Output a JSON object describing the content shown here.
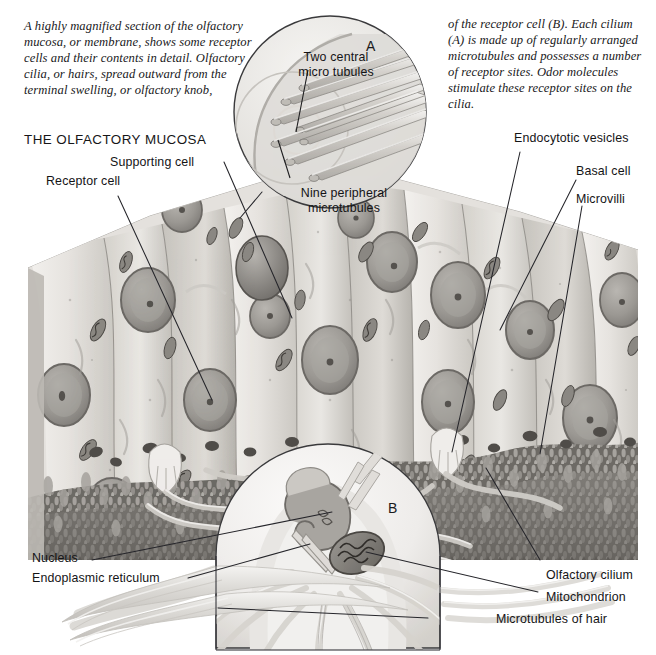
{
  "figure": {
    "title": "THE OLFACTORY MUCOSA",
    "caption_left": "A highly magnified section of the olfactory mucosa, or membrane, shows some receptor cells and their contents in detail. Olfactory cilia, or hairs, spread outward from the terminal swelling, or olfactory knob,",
    "caption_right": "of the receptor cell (B). Each cilium (A) is made up of regularly arranged microtubules and possesses a number of receptor sites. Odor molecules stimulate these receptor sites on the cilia."
  },
  "inset_markers": {
    "a": "A",
    "b": "B"
  },
  "labels": {
    "inset_a_central": "Two central\nmicrotubules",
    "inset_a_central_line1": "Two central",
    "inset_a_central_line2": "micro tubules",
    "inset_a_peripheral_line1": "Nine peripheral",
    "inset_a_peripheral_line2": "microtubules",
    "supporting_cell": "Supporting cell",
    "receptor_cell": "Receptor cell",
    "endocytotic_vesicles": "Endocytotic vesicles",
    "basal_cell": "Basal cell",
    "microvilli": "Microvilli",
    "nucleus": "Nucleus",
    "endoplasmic_reticulum": "Endoplasmic reticulum",
    "olfactory_cilium": "Olfactory cilium",
    "mitochondrion": "Mitochondrion",
    "microtubules_of_hair": "Microtubules  of hair"
  },
  "colors": {
    "background": "#ffffff",
    "ink": "#141416",
    "leader_line": "#2a2a2e",
    "cell_light": "#eceae6",
    "cell_mid": "#cfccc6",
    "cell_dark": "#a9a5a0",
    "nucleus_fill": "#9e9b96",
    "nucleus_rim": "#6f6c68",
    "basal_dark": "#6e6b66",
    "cilia": "#d9d7d2",
    "block_top": "#dbd8d3"
  }
}
